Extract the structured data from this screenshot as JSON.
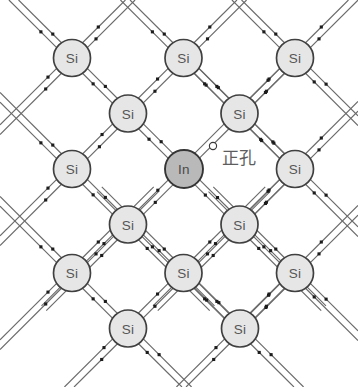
{
  "figure": {
    "width": 358,
    "height": 387,
    "background_color": "#ffffff"
  },
  "geometry": {
    "lattice_spacing_x": 111.5,
    "lattice_spacing_y": 55.5,
    "atom_radius_si": 18.5,
    "atom_radius_in": 19.0,
    "bond_offset": 3.4,
    "electron_dot_size": 3.1,
    "hole_radius": 3.6,
    "row_y": [
      58,
      113.5,
      169,
      224.5,
      273,
      328.5
    ],
    "rows": [
      {
        "y": 58,
        "x": [
          72,
          183.5,
          295
        ]
      },
      {
        "y": 113.5,
        "x": [
          128,
          239.5
        ]
      },
      {
        "y": 169,
        "x": [
          72,
          184,
          295
        ]
      },
      {
        "y": 224.5,
        "x": [
          128,
          239.5
        ]
      },
      {
        "y": 273,
        "x": [
          72,
          183.5,
          295
        ]
      },
      {
        "y": 328.5,
        "x": [
          128,
          240
        ]
      }
    ]
  },
  "colors": {
    "bond_line": "#6b6b6b",
    "electron": "#1c1c1c",
    "si_fill": "#e6e6e6",
    "si_stroke": "#404040",
    "in_fill": "#b9b9b9",
    "in_stroke": "#353535",
    "label_text": "#565656",
    "hole_stroke": "#3a3a3a",
    "hole_fill": "#ffffff",
    "annotation_text": "#5d5d5d"
  },
  "atoms": [
    {
      "id": "si-r1-c1",
      "element": "Si",
      "x": 72,
      "y": 58,
      "type": "host"
    },
    {
      "id": "si-r1-c2",
      "element": "Si",
      "x": 183.5,
      "y": 58,
      "type": "host"
    },
    {
      "id": "si-r1-c3",
      "element": "Si",
      "x": 295,
      "y": 58,
      "type": "host"
    },
    {
      "id": "si-r2-c1",
      "element": "Si",
      "x": 128,
      "y": 113.5,
      "type": "host"
    },
    {
      "id": "si-r2-c2",
      "element": "Si",
      "x": 239.5,
      "y": 113.5,
      "type": "host"
    },
    {
      "id": "si-r3-c1",
      "element": "Si",
      "x": 72,
      "y": 169,
      "type": "host"
    },
    {
      "id": "in-r3-c2",
      "element": "In",
      "x": 184,
      "y": 169,
      "type": "dopant"
    },
    {
      "id": "si-r3-c3",
      "element": "Si",
      "x": 295,
      "y": 169,
      "type": "host"
    },
    {
      "id": "si-r4-c1",
      "element": "Si",
      "x": 128,
      "y": 224.5,
      "type": "host"
    },
    {
      "id": "si-r4-c2",
      "element": "Si",
      "x": 239.5,
      "y": 224.5,
      "type": "host"
    },
    {
      "id": "si-r5-c1",
      "element": "Si",
      "x": 72,
      "y": 273,
      "type": "host"
    },
    {
      "id": "si-r5-c2",
      "element": "Si",
      "x": 183.5,
      "y": 273,
      "type": "host"
    },
    {
      "id": "si-r5-c3",
      "element": "Si",
      "x": 295,
      "y": 273,
      "type": "host"
    },
    {
      "id": "si-r6-c1",
      "element": "Si",
      "x": 128,
      "y": 328.5,
      "type": "host"
    },
    {
      "id": "si-r6-c2",
      "element": "Si",
      "x": 240,
      "y": 328.5,
      "type": "host"
    }
  ],
  "labels": {
    "si": "Si",
    "in": "In"
  },
  "hole": {
    "marker_x": 213,
    "marker_y": 146,
    "annotation": "正孔",
    "annotation_x": 222,
    "annotation_y": 150,
    "description": "hollow circle marking the missing electron (electron hole) on the In–Si bond"
  }
}
